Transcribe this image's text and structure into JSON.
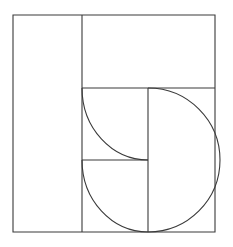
{
  "figure": {
    "background_color": "#ffffff",
    "stroke_color": "#3a3a3a",
    "stroke_width": 1.1,
    "canvas": {
      "width": 233,
      "height": 247
    },
    "bounds": {
      "left": 13,
      "top": 15,
      "right": 215,
      "bottom": 232,
      "width": 202,
      "height": 217
    },
    "elements": [
      {
        "name": "outer-rectangle",
        "type": "rect",
        "x": 13,
        "y": 15,
        "width": 202,
        "height": 217
      },
      {
        "name": "left-vertical-divider",
        "type": "line",
        "x1": 82,
        "y1": 15,
        "x2": 82,
        "y2": 232
      },
      {
        "name": "upper-horizontal-divider",
        "type": "line",
        "x1": 82,
        "y1": 88,
        "x2": 215,
        "y2": 88
      },
      {
        "name": "inner-vertical-divider",
        "type": "line",
        "x1": 148,
        "y1": 88,
        "x2": 148,
        "y2": 232
      },
      {
        "name": "middle-horizontal-divider",
        "type": "line",
        "x1": 82,
        "y1": 160,
        "x2": 148,
        "y2": 160
      },
      {
        "name": "large-semicircle-arc",
        "type": "arc",
        "center_x": 148,
        "center_y": 160,
        "radius": 72,
        "start_x": 148,
        "start_y": 88,
        "end_x": 148,
        "end_y": 232,
        "bulge": "right",
        "sweep_degrees": 180
      },
      {
        "name": "upper-quarter-arc",
        "type": "arc",
        "center_x": 148,
        "center_y": 88,
        "radius": 66,
        "start_x": 82,
        "start_y": 88,
        "end_x": 148,
        "end_y": 160,
        "bulge": "lower-left",
        "sweep_degrees": 90
      },
      {
        "name": "lower-quarter-arc",
        "type": "arc",
        "center_x": 148,
        "center_y": 160,
        "radius": 66,
        "start_x": 82,
        "start_y": 160,
        "end_x": 148,
        "end_y": 232,
        "bulge": "lower-left",
        "sweep_degrees": 90
      }
    ],
    "paths": {
      "outer_rectangle": "M 13 15 L 215 15 L 215 232 L 13 232 Z",
      "left_vertical_divider": "M 82 15 L 82 232",
      "upper_horizontal_divider": "M 82 88 L 215 88",
      "inner_vertical_divider": "M 148 88 L 148 232",
      "middle_horizontal_divider": "M 82 160 L 148 160",
      "large_semicircle_arc": "M 148 88 A 72 72 0 0 1 148 232",
      "upper_quarter_arc": "M 82 88 A 66 72 0 0 0 148 160",
      "lower_quarter_arc": "M 82 160 A 66 72 0 0 0 148 232"
    }
  }
}
